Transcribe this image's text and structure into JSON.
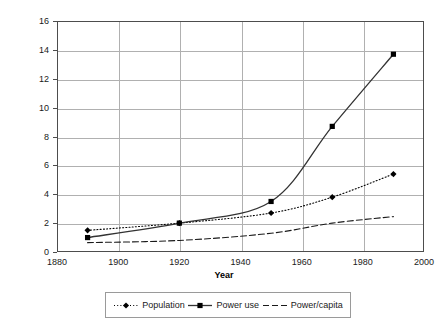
{
  "chart_data": {
    "type": "line",
    "title": "",
    "xlabel": "Year",
    "ylabel": "",
    "xlim": [
      1880,
      2000
    ],
    "ylim": [
      0,
      16
    ],
    "xticks": [
      1880,
      1900,
      1920,
      1940,
      1960,
      1980,
      2000
    ],
    "yticks": [
      0,
      2,
      4,
      6,
      8,
      10,
      12,
      14,
      16
    ],
    "grid": true,
    "legend_position": "bottom",
    "x": [
      1890,
      1920,
      1950,
      1970,
      1990
    ],
    "series": [
      {
        "name": "Population",
        "values": [
          1.5,
          2.0,
          2.7,
          3.8,
          5.4
        ],
        "line_style": "dotted",
        "marker": "diamond",
        "color": "#000000"
      },
      {
        "name": "Power use",
        "values": [
          1.0,
          2.0,
          3.5,
          8.7,
          13.7
        ],
        "line_style": "solid",
        "marker": "square",
        "color": "#333333"
      },
      {
        "name": "Power/capita",
        "values": [
          0.65,
          0.8,
          1.3,
          2.0,
          2.45
        ],
        "line_style": "dashed",
        "marker": "none",
        "color": "#1a1a1a"
      }
    ]
  },
  "axes": {
    "x_title": "Year",
    "x_tick_labels": [
      "1880",
      "1900",
      "1920",
      "1940",
      "1960",
      "1980",
      "2000"
    ],
    "y_tick_labels": [
      "0",
      "2",
      "4",
      "6",
      "8",
      "10",
      "12",
      "14",
      "16"
    ]
  },
  "legend": {
    "items": [
      {
        "label": "Population"
      },
      {
        "label": "Power use"
      },
      {
        "label": "Power/capita"
      }
    ]
  },
  "colors": {
    "grid": "#b0b0b0",
    "frame": "#4d4d4d",
    "series_line": "#333333",
    "text": "#1a1a1a",
    "background": "#ffffff"
  }
}
